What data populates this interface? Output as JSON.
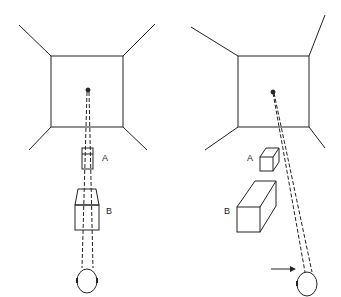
{
  "panels": [
    {
      "id": "left",
      "description": "Room view with eye fixating the far wall; objects A and B aligned along line of sight",
      "labels": {
        "a": "A",
        "b": "B"
      }
    },
    {
      "id": "right",
      "description": "Room view from shifted position; objects A and B offset from the line of sight",
      "labels": {
        "a": "A",
        "b": "B"
      }
    }
  ],
  "colors": {
    "line": "#222222",
    "background": "#ffffff"
  }
}
